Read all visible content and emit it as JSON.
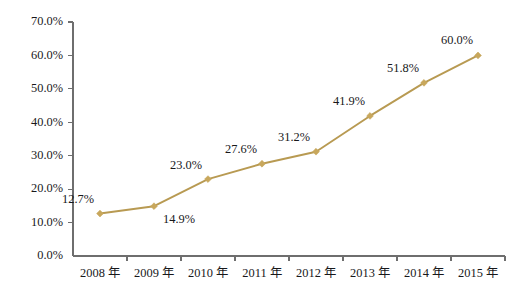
{
  "chart_data": {
    "type": "line",
    "title": "",
    "subtitle": "",
    "xlabel": "",
    "ylabel": "",
    "categories": [
      "2008 年",
      "2009 年",
      "2010 年",
      "2011 年",
      "2012 年",
      "2013 年",
      "2014 年",
      "2015 年"
    ],
    "values": [
      12.7,
      14.9,
      23.0,
      27.6,
      31.2,
      41.9,
      51.8,
      60.0
    ],
    "point_labels": [
      "12.7%",
      "14.9%",
      "23.0%",
      "27.6%",
      "31.2%",
      "41.9%",
      "51.8%",
      "60.0%"
    ],
    "ylim": [
      0,
      70
    ],
    "ytick_values": [
      0,
      10,
      20,
      30,
      40,
      50,
      60,
      70
    ],
    "ytick_labels": [
      "0.0%",
      "10.0%",
      "20.0%",
      "30.0%",
      "40.0%",
      "50.0%",
      "60.0%",
      "70.0%"
    ],
    "grid": false,
    "legend": false,
    "legend_position": "none",
    "series": [
      {
        "name": "",
        "values": [
          12.7,
          14.9,
          23.0,
          27.6,
          31.2,
          41.9,
          51.8,
          60.0
        ]
      }
    ],
    "label_offsets": [
      {
        "dx": -22,
        "dy": -13
      },
      {
        "dx": 25,
        "dy": 14
      },
      {
        "dx": -22,
        "dy": -13
      },
      {
        "dx": -21,
        "dy": -14
      },
      {
        "dx": -22,
        "dy": -14
      },
      {
        "dx": -21,
        "dy": -14
      },
      {
        "dx": -21,
        "dy": -14
      },
      {
        "dx": -21,
        "dy": -14
      }
    ]
  },
  "style": {
    "line_color": "#b89a52",
    "marker_color": "#c8a75c",
    "axis_color": "#6e6e6e",
    "text_color": "#18181a",
    "background": "#ffffff"
  },
  "geometry": {
    "plot_left": 73,
    "plot_right": 505,
    "plot_top": 22,
    "plot_bottom": 256
  }
}
